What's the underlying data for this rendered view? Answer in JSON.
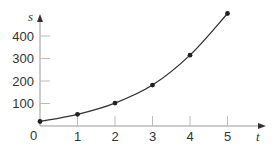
{
  "chart_data": {
    "type": "line",
    "title": "",
    "xlabel": "t",
    "ylabel": "s",
    "x": [
      0,
      1,
      2,
      3,
      4,
      5
    ],
    "series": [
      {
        "name": "s(t)",
        "values": [
          20,
          52,
          102,
          182,
          315,
          500
        ],
        "markers": true,
        "smooth": true
      }
    ],
    "x_ticks": [
      "0",
      "1",
      "2",
      "3",
      "4",
      "5"
    ],
    "y_ticks": [
      "100",
      "200",
      "300",
      "400"
    ],
    "origin_label": "0",
    "xlim": [
      0,
      5.5
    ],
    "ylim": [
      0,
      500
    ],
    "grid": false,
    "legend": "none",
    "colors": {
      "line": "#333333",
      "axis": "#999999",
      "text": "#333333"
    }
  }
}
